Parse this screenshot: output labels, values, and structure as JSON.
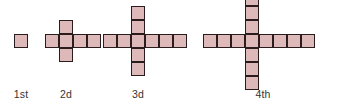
{
  "background_color": "#ffffff",
  "figure": {
    "title": "",
    "cell_fill_color": "#ddb9b9",
    "cell_border_color": "#2a1c1c",
    "label_color": "#333333",
    "cell_size_px": 14,
    "items": [
      {
        "label": "1st",
        "shape": "square",
        "horizontal_arm_cells": 1,
        "vertical_arm_cells": 1,
        "total_cells": 1,
        "center_x": 21,
        "center_y": 41,
        "label_x": 21,
        "label_y": 88
      },
      {
        "label": "2d",
        "shape": "cross",
        "horizontal_arm_cells": 4,
        "vertical_arm_cells": 3,
        "total_cells": 6,
        "horizontal_left_cells": 1,
        "horizontal_right_cells": 2,
        "vertical_up_cells": 1,
        "vertical_down_cells": 1,
        "center_x": 66,
        "center_y": 41,
        "label_x": 66,
        "label_y": 88
      },
      {
        "label": "3d",
        "shape": "cross",
        "horizontal_arm_cells": 6,
        "vertical_arm_cells": 5,
        "total_cells": 10,
        "horizontal_left_cells": 2,
        "horizontal_right_cells": 3,
        "vertical_up_cells": 2,
        "vertical_down_cells": 2,
        "center_x": 138,
        "center_y": 41,
        "label_x": 138,
        "label_y": 88
      },
      {
        "label": "4th",
        "shape": "cross",
        "horizontal_arm_cells": 8,
        "vertical_arm_cells": 7,
        "total_cells": 14,
        "horizontal_left_cells": 3,
        "horizontal_right_cells": 4,
        "vertical_up_cells": 3,
        "vertical_down_cells": 3,
        "center_x": 252,
        "center_y": 41,
        "label_x": 263,
        "label_y": 88
      }
    ]
  },
  "chart_data": {
    "type": "diagram",
    "title": "",
    "categories": [
      "1st",
      "2d",
      "3d",
      "4th"
    ],
    "values": [
      1,
      6,
      10,
      14
    ],
    "series": [
      {
        "name": "horizontal arm cells",
        "values": [
          1,
          4,
          6,
          8
        ]
      },
      {
        "name": "vertical arm cells",
        "values": [
          1,
          3,
          5,
          7
        ]
      },
      {
        "name": "total cells",
        "values": [
          1,
          6,
          10,
          14
        ]
      }
    ],
    "xlabel": "",
    "ylabel": ""
  }
}
